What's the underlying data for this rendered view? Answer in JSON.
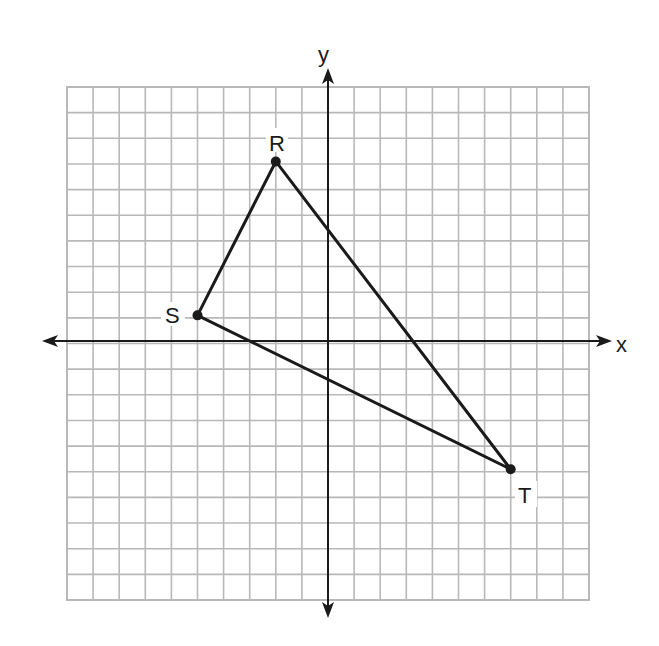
{
  "grid": {
    "x_min": -10,
    "x_max": 10,
    "y_min": -10,
    "y_max": 10,
    "left_px": 67,
    "top_px": 87,
    "right_px": 589,
    "bottom_px": 600,
    "origin_px": [
      328,
      341
    ],
    "cell_px_x": 26.1,
    "cell_px_y": 25.65,
    "grid_color": "#b8b8b8",
    "axis_color": "#1a1a1a"
  },
  "axes": {
    "x_label": "x",
    "y_label": "y"
  },
  "triangle": {
    "stroke_color": "#1a1a1a",
    "points": [
      {
        "name": "R",
        "x": -2,
        "y": 7
      },
      {
        "name": "S",
        "x": -5,
        "y": 1
      },
      {
        "name": "T",
        "x": 7,
        "y": -5
      }
    ]
  },
  "labels": {
    "R": "R",
    "S": "S",
    "T": "T"
  }
}
